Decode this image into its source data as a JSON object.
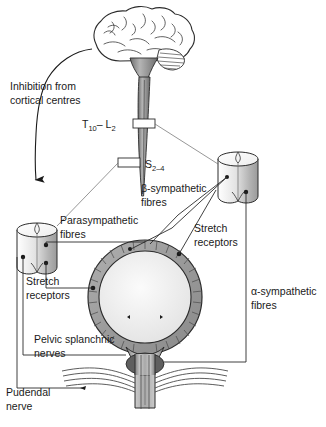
{
  "figure": {
    "labels": {
      "inhibition": {
        "line1": "Inhibition from",
        "line2": "cortical centres"
      },
      "thoracolumbar": {
        "main": "T",
        "sub1": "10",
        "dash": "– L",
        "sub2": "2",
        "full": "T10– L2"
      },
      "sacral": {
        "main": "S",
        "sub": "2–4",
        "full": "S2–4"
      },
      "beta_sympathetic": {
        "line1": "β-sympathetic",
        "line2": "fibres"
      },
      "alpha_sympathetic": {
        "line1": "α-sympathetic",
        "line2": "fibres"
      },
      "parasympathetic": {
        "line1": "Parasympathetic",
        "line2": "fibres"
      },
      "stretch_left": {
        "line1": "Stretch",
        "line2": "receptors"
      },
      "stretch_right": {
        "line1": "Stretch",
        "line2": "receptors"
      },
      "pelvic_splanchnic": {
        "line1": "Pelvic splanchnic",
        "line2": "nerves"
      },
      "pudendal": {
        "line1": "Pudendal",
        "line2": "nerve"
      }
    },
    "parts": {
      "brain": "brain",
      "spinal_cord": "spinal-cord",
      "left_ganglion": "parasympathetic-ganglion",
      "right_ganglion": "sympathetic-ganglion",
      "bladder": "urinary-bladder",
      "detrusor": "detrusor-muscle",
      "urethra": "urethra",
      "internal_sphincter": "internal-urethral-sphincter",
      "pelvic_floor": "pelvic-floor-muscle"
    },
    "colors": {
      "ink": "#2b2b2b",
      "wall_gray": "#9a9a9a",
      "lumen": "#f2f2f2",
      "cord_gray": "#8e8e8e",
      "sphincter": "#5a5a5a",
      "background": "#ffffff"
    }
  }
}
